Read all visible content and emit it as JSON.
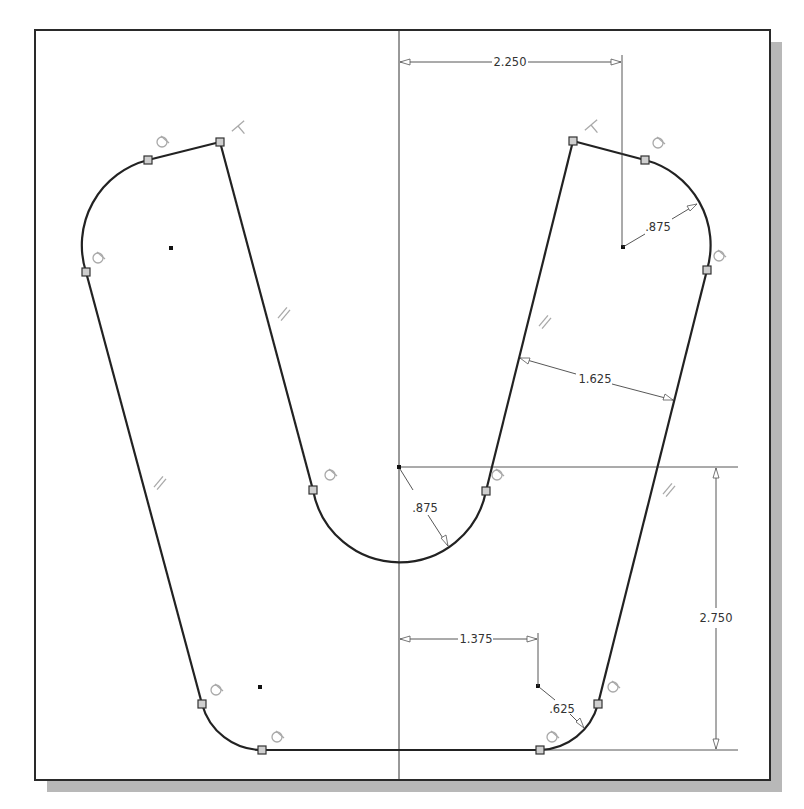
{
  "sketch": {
    "frame": {
      "x": 35,
      "y": 30,
      "width": 735,
      "height": 750,
      "shadow_offset": 12
    },
    "colors": {
      "profile": "#222222",
      "dimension": "#444444",
      "constraint_glyph": "#a9a9a9",
      "shadow": "#b8b8b8"
    },
    "centerline_x": 399,
    "horizontal_ref_y": 467,
    "bottom_ref_y": 750,
    "dimensions": [
      {
        "id": "top-width",
        "label": "2.250",
        "type": "linear-horizontal",
        "value": 2.25
      },
      {
        "id": "top-right-radius",
        "label": ".875",
        "type": "radius",
        "value": 0.875
      },
      {
        "id": "slot-width",
        "label": "1.625",
        "type": "aligned",
        "value": 1.625
      },
      {
        "id": "bottom-arc-radius",
        "label": ".875",
        "type": "radius",
        "value": 0.875
      },
      {
        "id": "bottom-offset",
        "label": "1.375",
        "type": "linear-horizontal",
        "value": 1.375
      },
      {
        "id": "bottom-right-radius",
        "label": ".625",
        "type": "radius",
        "value": 0.625
      },
      {
        "id": "height",
        "label": "2.750",
        "type": "linear-vertical",
        "value": 2.75
      }
    ],
    "constraints": {
      "tangent_icons": 10,
      "perpendicular_icons": 2,
      "parallel_icons": 4
    }
  }
}
